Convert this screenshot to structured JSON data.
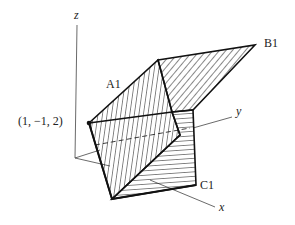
{
  "labels": {
    "z_axis": "z",
    "y_axis": "y",
    "x_axis": "x",
    "point": "(1, −1, 2)",
    "a1": "A1",
    "b1": "B1",
    "c1": "C1"
  }
}
